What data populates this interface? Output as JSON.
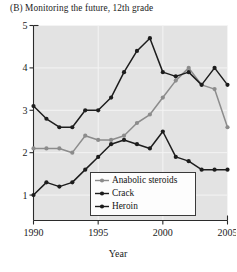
{
  "figure": {
    "panel_label": "(B)",
    "title": "(B)  Monitoring the future, 12th grade",
    "xaxis_title": "Year",
    "background": "#e3e3e3",
    "page_background": "#ffffff"
  },
  "legend": {
    "entries": [
      {
        "label": "Anabolic steroids",
        "color": "#8c8c8c",
        "marker": "circle"
      },
      {
        "label": "Crack",
        "color": "#1d1d1d",
        "marker": "circle"
      },
      {
        "label": "Heroin",
        "color": "#1d1d1d",
        "marker": "circle"
      }
    ]
  },
  "axes": {
    "y_ticks": [
      "1",
      "2",
      "3",
      "4",
      "5"
    ],
    "x_ticks": [
      "1990",
      "1995",
      "2000",
      "2005"
    ]
  },
  "chart_data": {
    "type": "line",
    "title": "(B)  Monitoring the future, 12th grade",
    "xlabel": "Year",
    "ylabel": "",
    "xlim": [
      1990,
      2005
    ],
    "ylim": [
      0.4,
      5.0
    ],
    "x": [
      1990,
      1991,
      1992,
      1993,
      1994,
      1995,
      1996,
      1997,
      1998,
      1999,
      2000,
      2001,
      2002,
      2003,
      2004,
      2005
    ],
    "grid": true,
    "grid_color": "#f4f4f4",
    "legend_position": "bottom-center",
    "series": [
      {
        "name": "Anabolic steroids",
        "color": "#8c8c8c",
        "values": [
          2.1,
          2.1,
          2.1,
          2.0,
          2.4,
          2.3,
          2.3,
          2.4,
          2.7,
          2.9,
          3.3,
          3.7,
          4.0,
          3.6,
          3.5,
          2.6
        ]
      },
      {
        "name": "Crack",
        "color": "#1d1d1d",
        "values": [
          3.1,
          2.8,
          2.6,
          2.6,
          3.0,
          3.0,
          3.3,
          3.9,
          4.4,
          4.7,
          3.9,
          3.8,
          3.9,
          3.6,
          4.0,
          3.6
        ]
      },
      {
        "name": "Heroin",
        "color": "#1d1d1d",
        "values": [
          1.0,
          1.3,
          1.2,
          1.3,
          1.6,
          1.9,
          2.2,
          2.3,
          2.2,
          2.1,
          2.5,
          1.9,
          1.8,
          1.6,
          1.6,
          1.6
        ]
      }
    ]
  }
}
